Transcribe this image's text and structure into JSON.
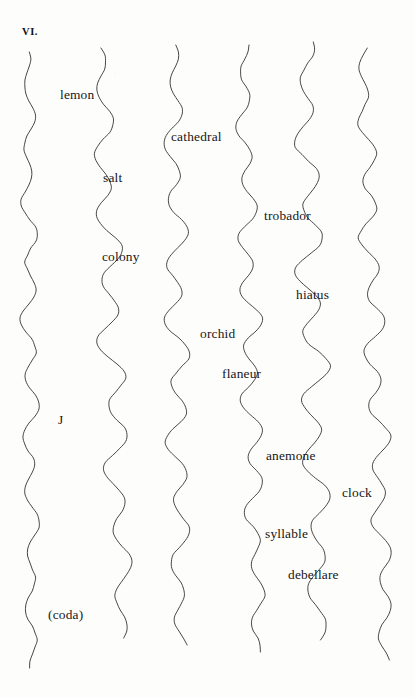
{
  "page": {
    "section_number": "VI.",
    "background_color": "#fdfdfc",
    "ink_color": "#2b2b2b",
    "text_color": "#161616",
    "width": 415,
    "height": 697
  },
  "strands": [
    {
      "id": "strand-1",
      "top_x": 28,
      "bottom_x": 32,
      "top_y": 52,
      "bottom_y": 668,
      "amplitude": 7,
      "period": 58
    },
    {
      "id": "strand-2",
      "top_x": 100,
      "bottom_x": 124,
      "top_y": 48,
      "bottom_y": 638,
      "amplitude": 11,
      "period": 63
    },
    {
      "id": "strand-3",
      "top_x": 173,
      "bottom_x": 181,
      "top_y": 45,
      "bottom_y": 645,
      "amplitude": 10,
      "period": 60
    },
    {
      "id": "strand-4",
      "top_x": 243,
      "bottom_x": 258,
      "top_y": 45,
      "bottom_y": 652,
      "amplitude": 9,
      "period": 55
    },
    {
      "id": "strand-5",
      "top_x": 305,
      "bottom_x": 320,
      "top_y": 42,
      "bottom_y": 640,
      "amplitude": 12,
      "period": 64
    },
    {
      "id": "strand-6",
      "top_x": 363,
      "bottom_x": 387,
      "top_y": 48,
      "bottom_y": 660,
      "amplitude": 9,
      "period": 57
    }
  ],
  "words": [
    {
      "id": "word-lemon",
      "text": "lemon",
      "x": 60,
      "y": 88
    },
    {
      "id": "word-cathedral",
      "text": "cathedral",
      "x": 171,
      "y": 130
    },
    {
      "id": "word-salt",
      "text": "salt",
      "x": 103,
      "y": 171
    },
    {
      "id": "word-trobador",
      "text": "trobador",
      "x": 264,
      "y": 209
    },
    {
      "id": "word-colony",
      "text": "colony",
      "x": 102,
      "y": 250
    },
    {
      "id": "word-hiatus",
      "text": "hiatus",
      "x": 296,
      "y": 288
    },
    {
      "id": "word-orchid",
      "text": "orchid",
      "x": 200,
      "y": 327
    },
    {
      "id": "word-flaneur",
      "text": "flaneur",
      "x": 222,
      "y": 367
    },
    {
      "id": "word-j",
      "text": "J",
      "x": 58,
      "y": 413
    },
    {
      "id": "word-anemone",
      "text": "anemone",
      "x": 266,
      "y": 449
    },
    {
      "id": "word-clock",
      "text": "clock",
      "x": 342,
      "y": 486
    },
    {
      "id": "word-syllable",
      "text": "syllable",
      "x": 265,
      "y": 527
    },
    {
      "id": "word-debellare",
      "text": "debellare",
      "x": 288,
      "y": 568
    },
    {
      "id": "word-coda",
      "text": "(coda)",
      "x": 48,
      "y": 608
    }
  ]
}
